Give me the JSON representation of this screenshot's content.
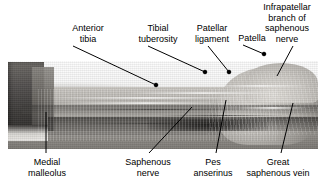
{
  "figure": {
    "kind": "anatomical-photograph",
    "image_description": "Grayscale cadaveric dissection photograph of the anteromedial lower limb, ankle at left and knee at right",
    "background_color": "#ffffff",
    "text_color": "#000000",
    "leader_color": "#000000"
  },
  "labels": {
    "top": [
      {
        "id": "anterior-tibia",
        "lines": [
          "Anterior",
          "tibia"
        ],
        "center_x": 88,
        "top_y": 23
      },
      {
        "id": "tibial-tuberosity",
        "lines": [
          "Tibial",
          "tuberosity"
        ],
        "center_x": 158,
        "top_y": 23
      },
      {
        "id": "patellar-ligament",
        "lines": [
          "Patellar",
          "ligament"
        ],
        "center_x": 212,
        "top_y": 23
      },
      {
        "id": "patella",
        "lines": [
          "Patella"
        ],
        "center_x": 252,
        "top_y": 33
      },
      {
        "id": "infrapatellar-branch-of-saphenous-nerve",
        "lines": [
          "Infrapatellar",
          "branch of",
          "saphenous",
          "nerve"
        ],
        "center_x": 287,
        "top_y": 2
      }
    ],
    "bottom": [
      {
        "id": "medial-malleolus",
        "lines": [
          "Medial",
          "malleolus"
        ],
        "center_x": 47,
        "top_y": 157
      },
      {
        "id": "saphenous-nerve",
        "lines": [
          "Saphenous",
          "nerve"
        ],
        "center_x": 148,
        "top_y": 157
      },
      {
        "id": "pes-anserinus",
        "lines": [
          "Pes",
          "anserinus"
        ],
        "center_x": 213,
        "top_y": 157
      },
      {
        "id": "great-saphenous-vein",
        "lines": [
          "Great",
          "saphenous vein"
        ],
        "center_x": 278,
        "top_y": 157
      }
    ]
  },
  "leaders": [
    {
      "for": "anterior-tibia",
      "x1": 73,
      "y1": 46,
      "x2": 156,
      "y2": 85,
      "dot": true
    },
    {
      "for": "tibial-tuberosity",
      "x1": 148,
      "y1": 46,
      "x2": 205,
      "y2": 72,
      "dot": true
    },
    {
      "for": "patellar-ligament",
      "x1": 208,
      "y1": 46,
      "x2": 229,
      "y2": 72,
      "dot": true
    },
    {
      "for": "patella",
      "x1": 243,
      "y1": 45,
      "x2": 264,
      "y2": 54,
      "dot": true
    },
    {
      "for": "infrapatellar-branch-of-saphenous-nerve",
      "x1": 293,
      "y1": 46,
      "x2": 277,
      "y2": 76,
      "dot": false
    },
    {
      "for": "medial-malleolus",
      "x1": 46,
      "y1": 112,
      "x2": 46,
      "y2": 153,
      "dot": false
    },
    {
      "for": "saphenous-nerve",
      "x1": 192,
      "y1": 107,
      "x2": 149,
      "y2": 153,
      "dot": false
    },
    {
      "for": "pes-anserinus",
      "x1": 226,
      "y1": 100,
      "x2": 216,
      "y2": 153,
      "dot": false
    },
    {
      "for": "great-saphenous-vein",
      "x1": 293,
      "y1": 103,
      "x2": 281,
      "y2": 153,
      "dot": false
    }
  ],
  "photo_region": {
    "x": 8,
    "y": 61,
    "width": 310,
    "height": 88
  }
}
